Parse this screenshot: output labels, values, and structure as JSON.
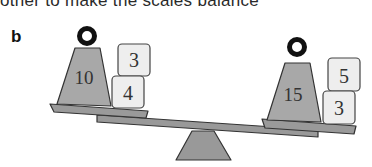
{
  "header": {
    "clipped_text": "other to make the scales balance"
  },
  "part_label": "b",
  "scale": {
    "left_pan": {
      "weight": {
        "label": "10"
      },
      "boxes": [
        {
          "label": "3"
        },
        {
          "label": "4"
        }
      ]
    },
    "right_pan": {
      "weight": {
        "label": "15"
      },
      "boxes": [
        {
          "label": "5"
        },
        {
          "label": "3"
        }
      ]
    }
  },
  "colors": {
    "weight_fill": "#a8a8a8",
    "box_fill": "#eeeeee",
    "ring": "#111111",
    "beam": "#999999",
    "outline": "#333333"
  }
}
